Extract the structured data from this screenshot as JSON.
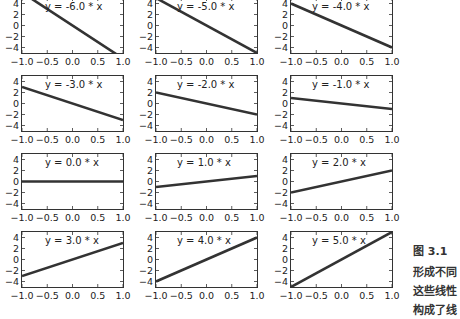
{
  "chart_data": {
    "type": "line",
    "layout": "4x3 grid of subplots",
    "xlim": [
      -1.0,
      1.0
    ],
    "ylim": [
      -5,
      5
    ],
    "x_ticks": [
      "−1.0",
      "−0.5",
      "0.0",
      "0.5",
      "1.0"
    ],
    "y_ticks": [
      "4",
      "2",
      "0",
      "−2",
      "−4"
    ],
    "line_color": "#333333",
    "panels": [
      {
        "label": "y = -6.0 * x",
        "slope": -6.0,
        "x": [
          -1,
          1
        ],
        "y": [
          6,
          -6
        ]
      },
      {
        "label": "y = -5.0 * x",
        "slope": -5.0,
        "x": [
          -1,
          1
        ],
        "y": [
          5,
          -5
        ]
      },
      {
        "label": "y = -4.0 * x",
        "slope": -4.0,
        "x": [
          -1,
          1
        ],
        "y": [
          4,
          -4
        ]
      },
      {
        "label": "y = -3.0 * x",
        "slope": -3.0,
        "x": [
          -1,
          1
        ],
        "y": [
          3,
          -3
        ]
      },
      {
        "label": "y = -2.0 * x",
        "slope": -2.0,
        "x": [
          -1,
          1
        ],
        "y": [
          2,
          -2
        ]
      },
      {
        "label": "y = -1.0 * x",
        "slope": -1.0,
        "x": [
          -1,
          1
        ],
        "y": [
          1,
          -1
        ]
      },
      {
        "label": "y = 0.0 * x",
        "slope": 0.0,
        "x": [
          -1,
          1
        ],
        "y": [
          0,
          0
        ]
      },
      {
        "label": "y = 1.0 * x",
        "slope": 1.0,
        "x": [
          -1,
          1
        ],
        "y": [
          -1,
          1
        ]
      },
      {
        "label": "y = 2.0 * x",
        "slope": 2.0,
        "x": [
          -1,
          1
        ],
        "y": [
          -2,
          2
        ]
      },
      {
        "label": "y = 3.0 * x",
        "slope": 3.0,
        "x": [
          -1,
          1
        ],
        "y": [
          -3,
          3
        ]
      },
      {
        "label": "y = 4.0 * x",
        "slope": 4.0,
        "x": [
          -1,
          1
        ],
        "y": [
          -4,
          4
        ]
      },
      {
        "label": "y = 5.0 * x",
        "slope": 5.0,
        "x": [
          -1,
          1
        ],
        "y": [
          -5,
          5
        ]
      }
    ]
  },
  "caption": {
    "lines": [
      "图 3.1　",
      "形成不同",
      "这些线性",
      "构成了线"
    ]
  }
}
